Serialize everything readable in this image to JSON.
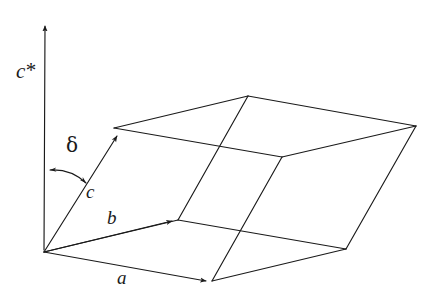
{
  "figure": {
    "type": "crystallographic-unit-cell-diagram",
    "background_color": "#ffffff",
    "line_color": "#1a1a1a",
    "canvas": {
      "width": 438,
      "height": 301
    }
  },
  "labels": {
    "c_star": "c",
    "c_star_superscript": "*",
    "delta": "δ",
    "c": "c",
    "b": "b",
    "a": "a"
  },
  "geometry": {
    "origin": {
      "x": 44,
      "y": 252
    },
    "vectors": {
      "a": {
        "x": 212,
        "y": 281
      },
      "b": {
        "x": 178,
        "y": 220
      },
      "c": {
        "x": 114,
        "y": 128
      }
    },
    "reciprocal_axis_c_star_tip": {
      "x": 45,
      "y": 20
    },
    "derived_vertices": {
      "ab": {
        "x": 346,
        "y": 249
      },
      "bc": {
        "x": 248,
        "y": 96
      },
      "ac": {
        "x": 282,
        "y": 157
      },
      "abc": {
        "x": 416,
        "y": 126
      }
    },
    "angle_arc": {
      "name": "delta",
      "between": [
        "c*",
        "c"
      ],
      "radius": 46,
      "double_headed": true
    }
  },
  "label_positions": {
    "c_star": {
      "x": 16,
      "y": 60
    },
    "delta": {
      "x": 66,
      "y": 135
    },
    "c": {
      "x": 86,
      "y": 182
    },
    "b": {
      "x": 107,
      "y": 208
    },
    "a": {
      "x": 117,
      "y": 268
    }
  }
}
